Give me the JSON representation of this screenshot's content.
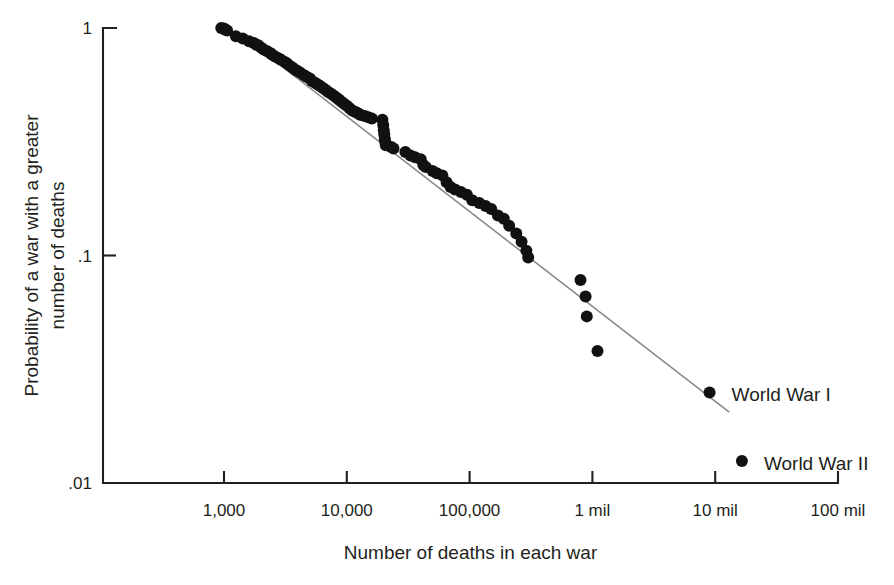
{
  "chart_data": {
    "type": "scatter",
    "title": "",
    "subtitle": "",
    "xlabel": "Number of deaths in each war",
    "ylabel": "Probability of a war with a greater number of deaths",
    "xscale": "log",
    "yscale": "log",
    "xlim": [
      350,
      100000000
    ],
    "ylim": [
      0.01,
      1
    ],
    "grid": false,
    "legend": "none",
    "x_tick_labels": [
      "1,000",
      "10,000",
      "100,000",
      "1 mil",
      "10 mil",
      "100 mil"
    ],
    "x_tick_values": [
      1000,
      10000,
      100000,
      1000000,
      10000000,
      100000000
    ],
    "y_tick_labels": [
      "1",
      ".1",
      ".01"
    ],
    "y_tick_values": [
      1,
      0.1,
      0.01
    ],
    "series": [
      {
        "name": "wars",
        "marker": "filled-circle",
        "color": "#111111",
        "points": [
          [
            950,
            1.0
          ],
          [
            1000,
            0.995
          ],
          [
            1010,
            0.985
          ],
          [
            1060,
            0.975
          ],
          [
            1250,
            0.92
          ],
          [
            1420,
            0.9
          ],
          [
            1600,
            0.875
          ],
          [
            1750,
            0.86
          ],
          [
            1830,
            0.845
          ],
          [
            1900,
            0.84
          ],
          [
            2000,
            0.82
          ],
          [
            2100,
            0.805
          ],
          [
            2250,
            0.79
          ],
          [
            2400,
            0.775
          ],
          [
            2450,
            0.765
          ],
          [
            2600,
            0.75
          ],
          [
            2800,
            0.735
          ],
          [
            2900,
            0.725
          ],
          [
            3100,
            0.71
          ],
          [
            3250,
            0.7
          ],
          [
            3400,
            0.685
          ],
          [
            3600,
            0.67
          ],
          [
            3800,
            0.655
          ],
          [
            4000,
            0.645
          ],
          [
            4200,
            0.635
          ],
          [
            4500,
            0.62
          ],
          [
            4700,
            0.61
          ],
          [
            5000,
            0.6
          ],
          [
            5200,
            0.585
          ],
          [
            5500,
            0.575
          ],
          [
            5800,
            0.565
          ],
          [
            6100,
            0.555
          ],
          [
            6400,
            0.545
          ],
          [
            6700,
            0.535
          ],
          [
            7000,
            0.525
          ],
          [
            7400,
            0.515
          ],
          [
            7800,
            0.505
          ],
          [
            8200,
            0.495
          ],
          [
            8600,
            0.485
          ],
          [
            9000,
            0.475
          ],
          [
            9500,
            0.465
          ],
          [
            10000,
            0.455
          ],
          [
            10500,
            0.445
          ],
          [
            11000,
            0.435
          ],
          [
            11500,
            0.43
          ],
          [
            12000,
            0.425
          ],
          [
            12500,
            0.42
          ],
          [
            13000,
            0.415
          ],
          [
            14000,
            0.41
          ],
          [
            15000,
            0.405
          ],
          [
            16000,
            0.4
          ],
          [
            19500,
            0.395
          ],
          [
            19800,
            0.375
          ],
          [
            20000,
            0.355
          ],
          [
            20200,
            0.34
          ],
          [
            20400,
            0.325
          ],
          [
            20600,
            0.315
          ],
          [
            20800,
            0.305
          ],
          [
            23000,
            0.3
          ],
          [
            24000,
            0.295
          ],
          [
            30000,
            0.285
          ],
          [
            33000,
            0.275
          ],
          [
            36000,
            0.27
          ],
          [
            40000,
            0.265
          ],
          [
            42000,
            0.25
          ],
          [
            44000,
            0.245
          ],
          [
            50000,
            0.235
          ],
          [
            54000,
            0.23
          ],
          [
            60000,
            0.225
          ],
          [
            65000,
            0.21
          ],
          [
            70000,
            0.2
          ],
          [
            76000,
            0.195
          ],
          [
            85000,
            0.19
          ],
          [
            95000,
            0.185
          ],
          [
            105000,
            0.175
          ],
          [
            120000,
            0.17
          ],
          [
            135000,
            0.165
          ],
          [
            150000,
            0.16
          ],
          [
            170000,
            0.15
          ],
          [
            190000,
            0.145
          ],
          [
            210000,
            0.135
          ],
          [
            240000,
            0.125
          ],
          [
            265000,
            0.115
          ],
          [
            290000,
            0.105
          ],
          [
            300000,
            0.098
          ],
          [
            800000,
            0.078
          ],
          [
            880000,
            0.066
          ],
          [
            900000,
            0.054
          ],
          [
            1100000,
            0.038
          ],
          [
            9000000,
            0.025
          ],
          [
            16500000,
            0.0125
          ]
        ]
      }
    ],
    "fit_line": {
      "name": "power-law fit",
      "color": "#8a8a8a",
      "x0": 1270,
      "y0": 0.965,
      "x1": 13000000,
      "y1": 0.0205
    },
    "annotations": [
      {
        "text": "World War I",
        "x": 9000000,
        "y": 0.025,
        "dx": 22,
        "dy": 3
      },
      {
        "text": "World War II",
        "x": 16500000,
        "y": 0.0125,
        "dx": 22,
        "dy": 3
      }
    ]
  }
}
